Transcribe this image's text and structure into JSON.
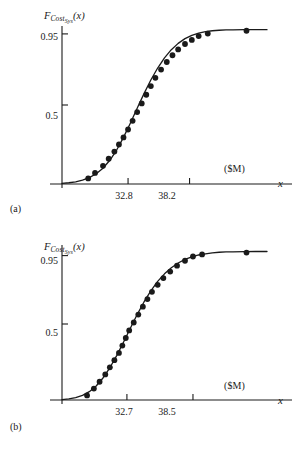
{
  "figure": {
    "background": "#ffffff",
    "ink_color": "#1a1a1a",
    "panels": [
      "a",
      "b"
    ]
  },
  "chart_data": [
    {
      "type": "line",
      "panel": "a",
      "caption": "(a)",
      "title": "",
      "ylabel": "F_CostSys(x)",
      "ylabel_parts": {
        "base": "F",
        "sub": "Cost",
        "subsub": "Sys",
        "arg": "(x)"
      },
      "xlabel": "x",
      "xunit": "($M)",
      "yticks": [
        0.5,
        0.95
      ],
      "ytick_labels": [
        "0.5",
        "0.95"
      ],
      "xticks": [
        32.8,
        38.2
      ],
      "xtick_labels": [
        "32.8",
        "38.2"
      ],
      "xlim": [
        27.0,
        45.0
      ],
      "ylim": [
        0.0,
        1.0
      ],
      "grid": false,
      "legend": "none",
      "series": [
        {
          "name": "fitted CDF curve",
          "style": "solid-line",
          "x": [
            27.0,
            27.6,
            28.2,
            28.8,
            29.4,
            30.0,
            30.6,
            31.2,
            31.8,
            32.4,
            33.0,
            33.6,
            34.2,
            34.8,
            35.4,
            36.0,
            36.6,
            37.2,
            37.8,
            38.4,
            39.0,
            39.6,
            40.2,
            40.8,
            41.4,
            42.0,
            43.0,
            44.0,
            45.0
          ],
          "y": [
            0.004,
            0.008,
            0.014,
            0.024,
            0.04,
            0.065,
            0.1,
            0.15,
            0.215,
            0.295,
            0.385,
            0.48,
            0.572,
            0.658,
            0.734,
            0.798,
            0.85,
            0.89,
            0.92,
            0.941,
            0.955,
            0.964,
            0.97,
            0.973,
            0.975,
            0.976,
            0.977,
            0.977,
            0.977
          ]
        },
        {
          "name": "empirical data points",
          "style": "filled-circle",
          "x": [
            29.3,
            29.9,
            30.6,
            31.1,
            31.6,
            32.0,
            32.4,
            32.8,
            33.2,
            33.6,
            34.0,
            34.4,
            34.8,
            35.2,
            35.7,
            36.2,
            36.7,
            37.2,
            37.8,
            38.4,
            39.0,
            39.8,
            43.2
          ],
          "y": [
            0.035,
            0.07,
            0.115,
            0.16,
            0.205,
            0.25,
            0.295,
            0.345,
            0.4,
            0.455,
            0.51,
            0.565,
            0.62,
            0.672,
            0.724,
            0.772,
            0.815,
            0.852,
            0.886,
            0.912,
            0.936,
            0.952,
            0.97
          ]
        }
      ]
    },
    {
      "type": "line",
      "panel": "b",
      "caption": "(b)",
      "title": "",
      "ylabel": "F_CostSys(x)",
      "ylabel_parts": {
        "base": "F",
        "sub": "Cost",
        "subsub": "Sys",
        "arg": "(x)"
      },
      "xlabel": "x",
      "xunit": "($M)",
      "yticks": [
        0.5,
        0.95
      ],
      "ytick_labels": [
        "0.5",
        "0.95"
      ],
      "xticks": [
        32.7,
        38.5
      ],
      "xtick_labels": [
        "32.7",
        "38.5"
      ],
      "xlim": [
        27.0,
        45.0
      ],
      "ylim": [
        0.0,
        1.0
      ],
      "grid": false,
      "legend": "none",
      "series": [
        {
          "name": "fitted CDF curve",
          "style": "solid-line",
          "x": [
            27.0,
            27.6,
            28.2,
            28.8,
            29.4,
            30.0,
            30.6,
            31.2,
            31.8,
            32.4,
            33.0,
            33.6,
            34.2,
            34.8,
            35.4,
            36.0,
            36.6,
            37.2,
            37.8,
            38.4,
            39.0,
            39.6,
            40.2,
            40.8,
            41.4,
            42.0,
            43.0,
            44.0,
            45.0
          ],
          "y": [
            0.003,
            0.007,
            0.015,
            0.03,
            0.055,
            0.092,
            0.145,
            0.212,
            0.292,
            0.38,
            0.472,
            0.562,
            0.645,
            0.718,
            0.78,
            0.83,
            0.87,
            0.901,
            0.925,
            0.942,
            0.954,
            0.962,
            0.968,
            0.972,
            0.974,
            0.975,
            0.976,
            0.977,
            0.977
          ]
        },
        {
          "name": "empirical data points",
          "style": "filled-circle",
          "x": [
            29.2,
            29.8,
            30.3,
            30.8,
            31.2,
            31.6,
            32.0,
            32.3,
            32.6,
            32.9,
            33.3,
            33.7,
            34.1,
            34.5,
            34.9,
            35.4,
            35.9,
            36.5,
            37.1,
            37.8,
            38.5,
            39.3,
            43.2
          ],
          "y": [
            0.03,
            0.075,
            0.12,
            0.168,
            0.215,
            0.262,
            0.31,
            0.358,
            0.408,
            0.458,
            0.51,
            0.562,
            0.614,
            0.664,
            0.712,
            0.758,
            0.802,
            0.845,
            0.884,
            0.916,
            0.944,
            0.958,
            0.97
          ]
        }
      ]
    }
  ]
}
